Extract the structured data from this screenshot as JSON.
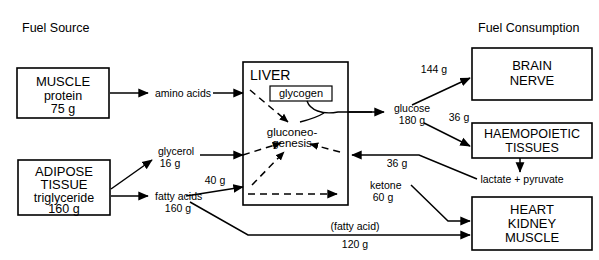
{
  "figure": {
    "title_left": "Fuel Source",
    "title_right": "Fuel Consumption"
  },
  "source_boxes": [
    {
      "id": "muscle",
      "line1": "MUSCLE",
      "line2": "protein",
      "line3": "75 g"
    },
    {
      "id": "adipose",
      "line1": "ADIPOSE",
      "line2": "TISSUE",
      "line3": "triglyceride",
      "line4": "160 g"
    }
  ],
  "organ": {
    "title": "LIVER",
    "store_label": "glycogen",
    "process_line1": "gluconeo-",
    "process_line2": "genesis"
  },
  "consumption_boxes": [
    {
      "id": "brain-nerve",
      "line1": "BRAIN",
      "line2": "NERVE"
    },
    {
      "id": "haemopoietic-tissues",
      "line1": "HAEMOPOIETIC",
      "line2": "TISSUES"
    },
    {
      "id": "heart-kidney-muscle",
      "line1": "HEART",
      "line2": "KIDNEY",
      "line3": "MUSCLE"
    }
  ],
  "edge_labels": {
    "amino_acids": "amino acids",
    "glycerol_name": "glycerol",
    "glycerol_amount": "16 g",
    "fatty_acids_name": "fatty acids",
    "fatty_acids_amount": "160 g",
    "liver_fa_input": "40 g",
    "glucose_name": "glucose",
    "glucose_amount": "180 g",
    "glucose_to_brain": "144 g",
    "glucose_to_haemo": "36 g",
    "lactate_recycle": "36 g",
    "lactate_pyruvate": "lactate + pyruvate",
    "ketone_name": "ketone",
    "ketone_amount": "60 g",
    "fatty_acid_direct_name": "(fatty acid)",
    "fatty_acid_direct_amount": "120 g"
  },
  "colors": {
    "ink": "#000000",
    "paper": "#ffffff"
  }
}
